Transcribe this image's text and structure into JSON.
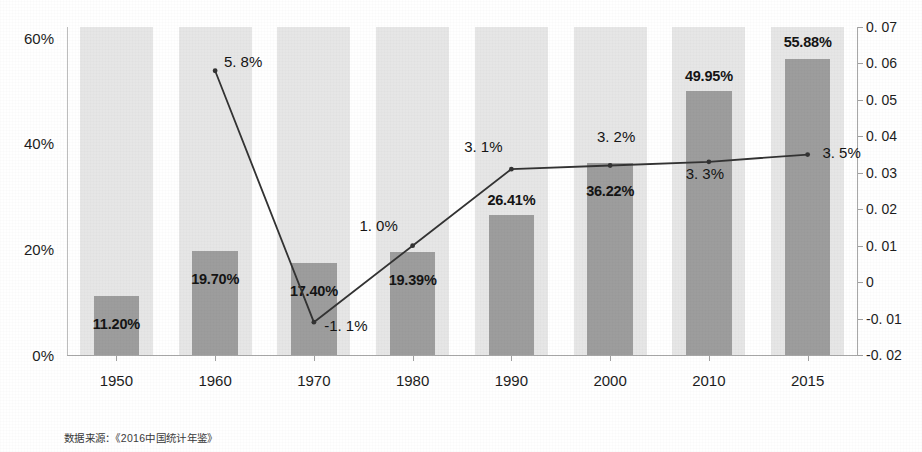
{
  "chart_data": {
    "type": "bar",
    "title": "",
    "subtitle": "",
    "xlabel": "",
    "ylabel": "",
    "grid": false,
    "legend_position": "none",
    "categories": [
      "1950",
      "1960",
      "1970",
      "1980",
      "1990",
      "2000",
      "2010",
      "2015"
    ],
    "axes": {
      "left": {
        "ylabel": "",
        "ylim": [
          0,
          0.62
        ],
        "tick_values": [
          0,
          0.2,
          0.4,
          0.6
        ],
        "tick_labels": [
          "0%",
          "20%",
          "40%",
          "60%"
        ]
      },
      "right": {
        "ylabel": "",
        "ylim": [
          -0.02,
          0.07
        ],
        "tick_values": [
          0.07,
          0.06,
          0.05,
          0.04,
          0.03,
          0.02,
          0.01,
          0,
          -0.01,
          -0.02
        ],
        "tick_labels": [
          "0. 07",
          "0. 06",
          "0. 05",
          "0. 04",
          "0. 03",
          "0. 02",
          "0. 01",
          "0",
          "-0. 01",
          "-0. 02"
        ]
      }
    },
    "series": [
      {
        "name": "bars",
        "type": "bar",
        "axis": "left",
        "color": "#9d9d9d",
        "values": [
          0.112,
          0.197,
          0.174,
          0.1939,
          0.2641,
          0.3622,
          0.4995,
          0.5588
        ],
        "data_labels": [
          "11.20%",
          "19.70%",
          "17.40%",
          "19.39%",
          "26.41%",
          "36.22%",
          "49.95%",
          "55.88%"
        ]
      },
      {
        "name": "line",
        "type": "line",
        "axis": "right",
        "color": "#333333",
        "x": [
          "1960",
          "1970",
          "1980",
          "1990",
          "2000",
          "2010",
          "2015"
        ],
        "values": [
          0.058,
          -0.011,
          0.01,
          0.031,
          0.032,
          0.033,
          0.035
        ],
        "data_labels": [
          "5. 8%",
          "-1. 1%",
          "1. 0%",
          "3. 1%",
          "3. 2%",
          "3. 3%",
          "3. 5%"
        ]
      }
    ],
    "band_color": "#e6e6e6",
    "footnote": "数据来源：《2016中国统计年鉴》"
  },
  "style": {
    "bar_color": "#9d9d9d",
    "band_color": "#e6e6e6",
    "line_color": "#333333",
    "text_color": "#141414",
    "axis_color": "#a8a8a8",
    "background": "#ffffff"
  }
}
